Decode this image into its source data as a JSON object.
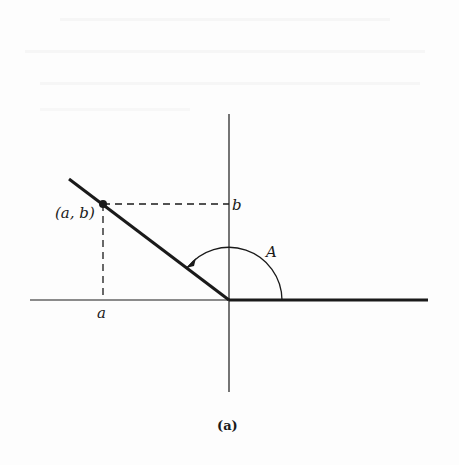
{
  "diagram": {
    "caption": "(a)",
    "labels": {
      "point": "(a, b)",
      "x_coord": "a",
      "y_coord": "b",
      "angle": "A"
    },
    "geometry": {
      "origin": [
        229,
        300
      ],
      "x_axis": [
        30,
        428
      ],
      "y_axis": [
        114,
        392
      ],
      "terminal_start": [
        69,
        179
      ],
      "point_ab": [
        103,
        204
      ],
      "angle_arc_radius": 53
    },
    "colors": {
      "ink": "#1a1a1a",
      "background": "#fdfdfd"
    }
  }
}
